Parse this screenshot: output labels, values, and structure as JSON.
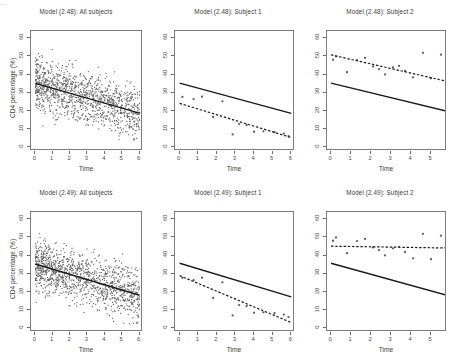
{
  "figure": {
    "width": 457,
    "height": 362,
    "background": "#ffffff",
    "point_color": "#606060",
    "line_color": "#1a1a1a",
    "axis_color": "#7d7d7d",
    "text_color": "#3d3d3d",
    "cropped_top_text": "—"
  },
  "axes": {
    "xlabel": "Time",
    "ylabel": "CD4 percentage (%)",
    "yticks": [
      0,
      10,
      20,
      30,
      40,
      50,
      60
    ],
    "ylim": [
      -2,
      64
    ],
    "xticks_full": [
      0,
      1,
      2,
      3,
      4,
      5,
      6
    ],
    "xticks_short": [
      0,
      1,
      2,
      3,
      4,
      5
    ],
    "xlim_full": [
      -0.25,
      6.2
    ],
    "xlim_short": [
      -0.2,
      5.8
    ]
  },
  "panels": [
    {
      "id": "p1",
      "title": "Model (2.48): All subjects",
      "row": 0,
      "col": 0,
      "show_ylabel": true,
      "show_yticks": true,
      "xticks": [
        0,
        1,
        2,
        3,
        4,
        5,
        6
      ],
      "kind": "scatter-cloud",
      "solid_line": {
        "x0": 0,
        "y0": 35.2,
        "x1": 6,
        "y1": 18.8
      },
      "dashed_line": null
    },
    {
      "id": "p2",
      "title": "Model (2.48): Subject 1",
      "row": 0,
      "col": 1,
      "show_ylabel": false,
      "show_yticks": true,
      "xticks": [
        0,
        1,
        2,
        3,
        4,
        5,
        6
      ],
      "kind": "subject",
      "solid_line": {
        "x0": 0,
        "y0": 35.3,
        "x1": 6,
        "y1": 18.7
      },
      "dashed_line": {
        "x0": 0,
        "y0": 24.2,
        "x1": 6,
        "y1": 5.4
      },
      "points": [
        [
          0.15,
          27.8
        ],
        [
          0.75,
          26.5
        ],
        [
          1.2,
          27.9
        ],
        [
          1.8,
          16.7
        ],
        [
          2.3,
          25.3
        ],
        [
          2.85,
          7.1
        ],
        [
          3.2,
          12.8
        ],
        [
          3.6,
          12.3
        ],
        [
          4.0,
          8.6
        ],
        [
          4.5,
          8.8
        ],
        [
          5.1,
          8.3
        ],
        [
          5.6,
          7.6
        ],
        [
          5.85,
          6.2
        ]
      ]
    },
    {
      "id": "p3",
      "title": "Model (2.48): Subject 2",
      "row": 0,
      "col": 2,
      "show_ylabel": false,
      "show_yticks": true,
      "xticks": [
        0,
        1,
        2,
        3,
        4,
        5
      ],
      "kind": "subject",
      "solid_line": {
        "x0": 0,
        "y0": 35.3,
        "x1": 5.8,
        "y1": 19.9
      },
      "dashed_line": {
        "x0": 0,
        "y0": 50.9,
        "x1": 5.8,
        "y1": 36.3
      },
      "points": [
        [
          0.1,
          48.2
        ],
        [
          0.25,
          50.0
        ],
        [
          0.8,
          41.3
        ],
        [
          1.3,
          48.0
        ],
        [
          1.7,
          49.2
        ],
        [
          2.1,
          44.5
        ],
        [
          2.4,
          43.0
        ],
        [
          2.7,
          40.1
        ],
        [
          3.1,
          44.0
        ],
        [
          3.4,
          44.8
        ],
        [
          3.7,
          42.0
        ],
        [
          4.1,
          38.5
        ],
        [
          4.6,
          52.0
        ],
        [
          5.0,
          38.0
        ],
        [
          5.5,
          51.0
        ]
      ]
    },
    {
      "id": "p4",
      "title": "Model (2.49): All subjects",
      "row": 1,
      "col": 0,
      "show_ylabel": true,
      "show_yticks": true,
      "xticks": [
        0,
        1,
        2,
        3,
        4,
        5,
        6
      ],
      "kind": "scatter-cloud",
      "solid_line": {
        "x0": 0,
        "y0": 35.4,
        "x1": 6,
        "y1": 18.2
      },
      "dashed_line": null
    },
    {
      "id": "p5",
      "title": "Model (2.49): Subject 1",
      "row": 1,
      "col": 1,
      "show_ylabel": false,
      "show_yticks": true,
      "xticks": [
        0,
        1,
        2,
        3,
        4,
        5,
        6
      ],
      "kind": "subject",
      "solid_line": {
        "x0": 0,
        "y0": 35.8,
        "x1": 6,
        "y1": 17.3
      },
      "dashed_line": {
        "x0": 0,
        "y0": 29.0,
        "x1": 6,
        "y1": 3.2
      },
      "points": [
        [
          0.15,
          27.8
        ],
        [
          0.75,
          26.5
        ],
        [
          1.2,
          27.9
        ],
        [
          1.8,
          16.7
        ],
        [
          2.3,
          25.3
        ],
        [
          2.85,
          7.1
        ],
        [
          3.2,
          12.8
        ],
        [
          3.6,
          12.3
        ],
        [
          4.0,
          8.6
        ],
        [
          4.5,
          8.8
        ],
        [
          5.1,
          8.3
        ],
        [
          5.6,
          7.6
        ],
        [
          5.85,
          6.2
        ]
      ]
    },
    {
      "id": "p6",
      "title": "Model (2.49): Subject 2",
      "row": 1,
      "col": 2,
      "show_ylabel": false,
      "show_yticks": true,
      "xticks": [
        0,
        1,
        2,
        3,
        4,
        5
      ],
      "kind": "subject",
      "solid_line": {
        "x0": 0,
        "y0": 35.8,
        "x1": 5.8,
        "y1": 18.2
      },
      "dashed_line": {
        "x0": 0,
        "y0": 45.2,
        "x1": 5.8,
        "y1": 44.2
      },
      "points": [
        [
          0.1,
          48.2
        ],
        [
          0.25,
          50.0
        ],
        [
          0.8,
          41.3
        ],
        [
          1.3,
          48.0
        ],
        [
          1.7,
          49.2
        ],
        [
          2.1,
          44.5
        ],
        [
          2.4,
          43.0
        ],
        [
          2.7,
          40.1
        ],
        [
          3.1,
          44.0
        ],
        [
          3.4,
          44.8
        ],
        [
          3.7,
          42.0
        ],
        [
          4.1,
          38.5
        ],
        [
          4.6,
          52.0
        ],
        [
          5.0,
          38.0
        ],
        [
          5.5,
          51.0
        ]
      ]
    }
  ],
  "chart_data": {
    "type": "scatter",
    "xlabel": "Time",
    "ylabel": "CD4 percentage (%)",
    "xlim": [
      0,
      6
    ],
    "ylim": [
      0,
      60
    ],
    "grid": false,
    "legend": null,
    "panel_grid": {
      "rows": 2,
      "cols": 3
    },
    "panels": [
      {
        "title": "Model (2.48): All subjects",
        "series": [
          {
            "name": "population-fit",
            "style": "solid",
            "points": [
              [
                0,
                35.2
              ],
              [
                6,
                18.8
              ]
            ]
          }
        ],
        "scatter_note": "dense cloud of all subjects' CD4 percentage observations, ~0-62% across time 0-6"
      },
      {
        "title": "Model (2.48): Subject 1",
        "series": [
          {
            "name": "population-fit",
            "style": "solid",
            "points": [
              [
                0,
                35.3
              ],
              [
                6,
                18.7
              ]
            ]
          },
          {
            "name": "subject-fit",
            "style": "dashed",
            "points": [
              [
                0,
                24.2
              ],
              [
                6,
                5.4
              ]
            ]
          },
          {
            "name": "observations",
            "style": "points",
            "points": [
              [
                0.15,
                27.8
              ],
              [
                0.75,
                26.5
              ],
              [
                1.2,
                27.9
              ],
              [
                1.8,
                16.7
              ],
              [
                2.3,
                25.3
              ],
              [
                2.85,
                7.1
              ],
              [
                3.2,
                12.8
              ],
              [
                3.6,
                12.3
              ],
              [
                4.0,
                8.6
              ],
              [
                4.5,
                8.8
              ],
              [
                5.1,
                8.3
              ],
              [
                5.6,
                7.6
              ],
              [
                5.85,
                6.2
              ]
            ]
          }
        ]
      },
      {
        "title": "Model (2.48): Subject 2",
        "series": [
          {
            "name": "population-fit",
            "style": "solid",
            "points": [
              [
                0,
                35.3
              ],
              [
                5.8,
                19.9
              ]
            ]
          },
          {
            "name": "subject-fit",
            "style": "dashed",
            "points": [
              [
                0,
                50.9
              ],
              [
                5.8,
                36.3
              ]
            ]
          },
          {
            "name": "observations",
            "style": "points",
            "points": [
              [
                0.1,
                48.2
              ],
              [
                0.25,
                50.0
              ],
              [
                0.8,
                41.3
              ],
              [
                1.3,
                48.0
              ],
              [
                1.7,
                49.2
              ],
              [
                2.1,
                44.5
              ],
              [
                2.4,
                43.0
              ],
              [
                2.7,
                40.1
              ],
              [
                3.1,
                44.0
              ],
              [
                3.4,
                44.8
              ],
              [
                3.7,
                42.0
              ],
              [
                4.1,
                38.5
              ],
              [
                4.6,
                52.0
              ],
              [
                5.0,
                38.0
              ],
              [
                5.5,
                51.0
              ]
            ]
          }
        ]
      },
      {
        "title": "Model (2.49): All subjects",
        "series": [
          {
            "name": "population-fit",
            "style": "solid",
            "points": [
              [
                0,
                35.4
              ],
              [
                6,
                18.2
              ]
            ]
          }
        ],
        "scatter_note": "dense cloud of all subjects' CD4 percentage observations, ~0-62% across time 0-6"
      },
      {
        "title": "Model (2.49): Subject 1",
        "series": [
          {
            "name": "population-fit",
            "style": "solid",
            "points": [
              [
                0,
                35.8
              ],
              [
                6,
                17.3
              ]
            ]
          },
          {
            "name": "subject-fit",
            "style": "dashed",
            "points": [
              [
                0,
                29.0
              ],
              [
                6,
                3.2
              ]
            ]
          },
          {
            "name": "observations",
            "style": "points",
            "points": [
              [
                0.15,
                27.8
              ],
              [
                0.75,
                26.5
              ],
              [
                1.2,
                27.9
              ],
              [
                1.8,
                16.7
              ],
              [
                2.3,
                25.3
              ],
              [
                2.85,
                7.1
              ],
              [
                3.2,
                12.8
              ],
              [
                3.6,
                12.3
              ],
              [
                4.0,
                8.6
              ],
              [
                4.5,
                8.8
              ],
              [
                5.1,
                8.3
              ],
              [
                5.6,
                7.6
              ],
              [
                5.85,
                6.2
              ]
            ]
          }
        ]
      },
      {
        "title": "Model (2.49): Subject 2",
        "series": [
          {
            "name": "population-fit",
            "style": "solid",
            "points": [
              [
                0,
                35.8
              ],
              [
                5.8,
                18.2
              ]
            ]
          },
          {
            "name": "subject-fit",
            "style": "dashed",
            "points": [
              [
                0,
                45.2
              ],
              [
                5.8,
                44.2
              ]
            ]
          },
          {
            "name": "observations",
            "style": "points",
            "points": [
              [
                0.1,
                48.2
              ],
              [
                0.25,
                50.0
              ],
              [
                0.8,
                41.3
              ],
              [
                1.3,
                48.0
              ],
              [
                1.7,
                49.2
              ],
              [
                2.1,
                44.5
              ],
              [
                2.4,
                43.0
              ],
              [
                2.7,
                40.1
              ],
              [
                3.1,
                44.0
              ],
              [
                3.4,
                44.8
              ],
              [
                3.7,
                42.0
              ],
              [
                4.1,
                38.5
              ],
              [
                4.6,
                52.0
              ],
              [
                5.0,
                38.0
              ],
              [
                5.5,
                51.0
              ]
            ]
          }
        ]
      }
    ]
  }
}
